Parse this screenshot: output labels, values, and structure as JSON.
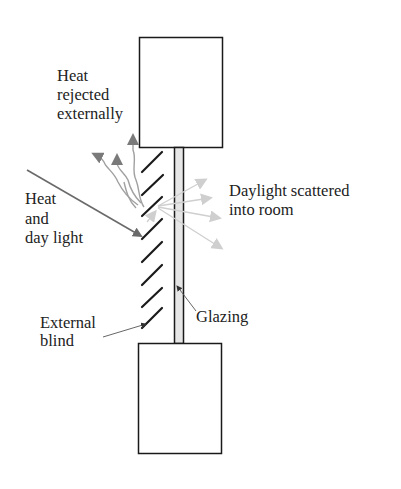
{
  "diagram": {
    "labels": {
      "heat_rejected": [
        "Heat",
        "rejected",
        "externally"
      ],
      "heat_daylight": [
        "Heat",
        "and",
        "day light"
      ],
      "daylight_scattered": [
        "Daylight scattered",
        "into room"
      ],
      "glazing": "Glazing",
      "external_blind": [
        "External",
        "blind"
      ]
    },
    "colors": {
      "outline": "#1a1a1a",
      "heat_arrow": "#6e6e6e",
      "heat_wave": "#9a9a9a",
      "daylight_arrow": "#c8c8c8",
      "glazing_fill": "#e6e6e6"
    }
  }
}
